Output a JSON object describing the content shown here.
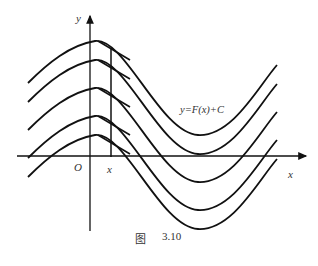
{
  "figure": {
    "caption_prefix": "图",
    "caption_number": "3.10",
    "curve_label": "y=F(x)+C",
    "axis_x_label": "x",
    "axis_y_label": "y",
    "origin_label": "O",
    "point_label": "x",
    "colors": {
      "stroke": "#111111",
      "background": "#ffffff"
    }
  },
  "curves": [
    {
      "shift": 0
    },
    {
      "shift": 1
    },
    {
      "shift": 2
    },
    {
      "shift": 3
    },
    {
      "shift": 4
    }
  ]
}
